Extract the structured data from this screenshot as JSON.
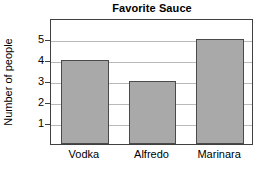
{
  "chart_data": {
    "type": "bar",
    "title": "Favorite Sauce",
    "xlabel": "",
    "ylabel": "Number of people",
    "categories": [
      "Vodka",
      "Alfredo",
      "Marinara"
    ],
    "values": [
      4,
      3,
      5
    ],
    "ylim": [
      0,
      6
    ],
    "ytick_labels": [
      "1",
      "2",
      "3",
      "4",
      "5"
    ],
    "ytick_values": [
      1,
      2,
      3,
      4,
      5
    ],
    "grid": true,
    "legend": "none",
    "bar_fill_color": "#a9a9a9",
    "bar_edge_color": "#4a4a4a",
    "gridline_color": "#b9b9b9",
    "axis_color": "#404040",
    "background_color": "#ffffff"
  }
}
